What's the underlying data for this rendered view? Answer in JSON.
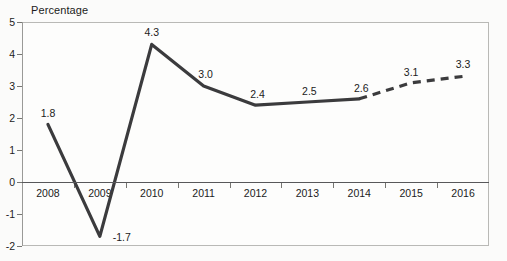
{
  "chart_data": {
    "type": "line",
    "title": "",
    "ylabel": "Percentage",
    "xlabel": "",
    "ylim": [
      -2,
      5
    ],
    "grid": false,
    "legend": "none",
    "categories": [
      "2008",
      "2009",
      "2010",
      "2011",
      "2012",
      "2013",
      "2014",
      "2015",
      "2016"
    ],
    "series": [
      {
        "name": "Percentage",
        "values": [
          1.8,
          -1.7,
          4.3,
          3.0,
          2.4,
          2.5,
          2.6,
          3.1,
          3.3
        ],
        "style": "solid-then-dashed",
        "dashed_from_index": 6,
        "color": "#3b3b3d"
      }
    ],
    "point_labels": [
      "1.8",
      "-1.7",
      "4.3",
      "3.0",
      "2.4",
      "2.5",
      "2.6",
      "3.1",
      "3.3"
    ],
    "y_ticks": [
      "5",
      "4",
      "3",
      "2",
      "1",
      "0",
      "-1",
      "-2"
    ],
    "y_tick_values": [
      5,
      4,
      3,
      2,
      1,
      0,
      -1,
      -2
    ],
    "zero_line": 0
  },
  "colors": {
    "line": "#3b3b3d",
    "axis": "#767672",
    "zero_axis": "#58585a",
    "frame": "#b9b9b6",
    "text": "#1b1b1b",
    "panel_bg": "#fdfdfc",
    "page_bg": "#fbfbfa"
  }
}
